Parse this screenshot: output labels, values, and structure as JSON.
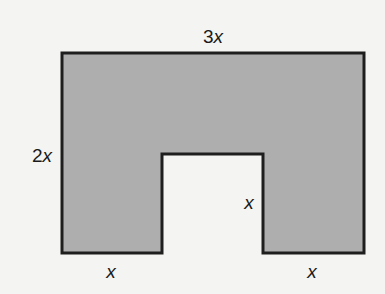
{
  "figure": {
    "fill_color": "#aeaeae",
    "stroke_color": "#1e1e1e",
    "labels": {
      "top": {
        "coef": "3",
        "var": "x"
      },
      "left": {
        "coef": "2",
        "var": "x"
      },
      "notch_height": {
        "coef": "",
        "var": "x"
      },
      "bottom_left": {
        "coef": "",
        "var": "x"
      },
      "bottom_right": {
        "coef": "",
        "var": "x"
      }
    }
  }
}
